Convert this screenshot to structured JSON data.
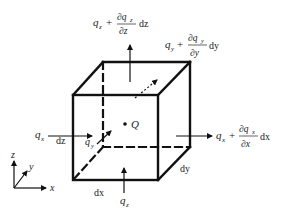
{
  "diagram": {
    "colors": {
      "stroke": "#111111",
      "text": "#222222",
      "background": "#ffffff"
    },
    "cube": {
      "front_top_left": [
        73,
        95
      ],
      "front_top_right": [
        158,
        95
      ],
      "front_bottom_left": [
        73,
        180
      ],
      "front_bottom_right": [
        158,
        180
      ],
      "back_top_left": [
        103,
        62
      ],
      "back_top_right": [
        190,
        62
      ],
      "back_bottom_right": [
        190,
        147
      ],
      "back_bottom_left_hidden": [
        103,
        147
      ]
    },
    "labels": {
      "qz_top_var": "q",
      "qz_top_sub": "z",
      "qz_top_plus": "+",
      "qz_top_num": "∂q",
      "qz_top_num_sub": "z",
      "qz_top_den": "∂z",
      "qz_top_d": "dz",
      "qy_top_var": "q",
      "qy_top_sub": "y",
      "qy_top_plus": "+",
      "qy_top_num": "∂q",
      "qy_top_num_sub": "y",
      "qy_top_den": "∂y",
      "qy_top_d": "dy",
      "qx_left_var": "q",
      "qx_left_sub": "x",
      "qx_right_var": "q",
      "qx_right_sub": "x",
      "qx_right_plus": "+",
      "qx_right_num": "∂q",
      "qx_right_num_sub": "x",
      "qx_right_den": "∂x",
      "qx_right_d": "dx",
      "qy_inner_var": "q",
      "qy_inner_sub": "y",
      "qz_bottom_var": "q",
      "qz_bottom_sub": "z",
      "point_Q": "Q",
      "dim_dz": "dz",
      "dim_dx": "dx",
      "dim_dy": "dy"
    },
    "axes": {
      "z": "z",
      "y": "y",
      "x": "x"
    }
  }
}
